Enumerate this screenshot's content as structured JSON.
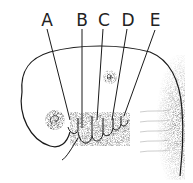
{
  "diagram": {
    "labels": [
      {
        "id": "A",
        "text": "A",
        "x": 47,
        "y": 12
      },
      {
        "id": "B",
        "text": "B",
        "x": 82,
        "y": 12
      },
      {
        "id": "C",
        "text": "C",
        "x": 104,
        "y": 12
      },
      {
        "id": "D",
        "text": "D",
        "x": 128,
        "y": 12
      },
      {
        "id": "E",
        "text": "E",
        "x": 155,
        "y": 12
      }
    ],
    "colors": {
      "ink": "#1a1a1a",
      "background": "#ffffff",
      "stipple": "#555555"
    }
  }
}
